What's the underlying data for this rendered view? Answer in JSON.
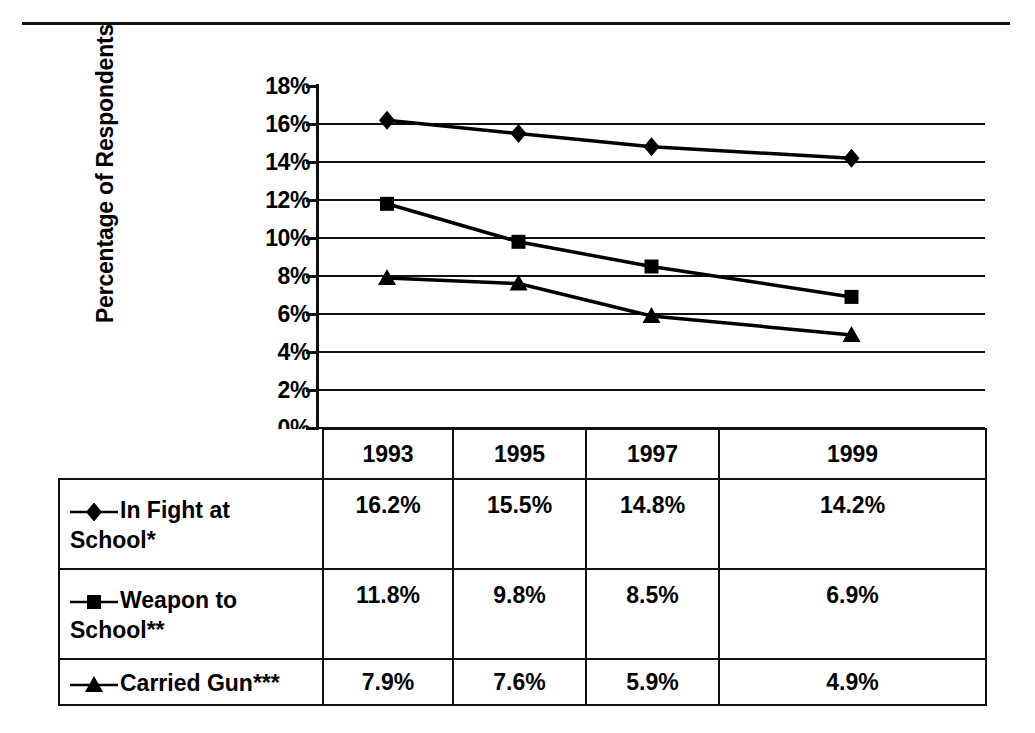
{
  "chart_data": {
    "type": "line",
    "title": "",
    "subtitle": "",
    "xlabel": "",
    "ylabel": "Percentage of Respondents",
    "categories": [
      "1993",
      "1995",
      "1997",
      "1999"
    ],
    "x": [
      1993,
      1995,
      1997,
      1999
    ],
    "ylim": [
      0,
      18
    ],
    "ytick_step": 2,
    "ytick_labels": [
      "18%",
      "16%",
      "14%",
      "12%",
      "10%",
      "8%",
      "6%",
      "4%",
      "2%",
      "0%"
    ],
    "ytick_values": [
      18,
      16,
      14,
      12,
      10,
      8,
      6,
      4,
      2,
      0
    ],
    "grid": true,
    "legend_position": "table-below",
    "series": [
      {
        "name": "In Fight at School*",
        "marker": "diamond",
        "color": "#000000",
        "values": [
          16.2,
          15.5,
          14.8,
          14.2
        ],
        "labels": [
          "16.2%",
          "15.5%",
          "14.8%",
          "14.2%"
        ]
      },
      {
        "name": "Weapon to School**",
        "marker": "square",
        "color": "#000000",
        "values": [
          11.8,
          9.8,
          8.5,
          6.9
        ],
        "labels": [
          "11.8%",
          "9.8%",
          "8.5%",
          "6.9%"
        ]
      },
      {
        "name": "Carried Gun***",
        "marker": "triangle",
        "color": "#000000",
        "values": [
          7.9,
          7.6,
          5.9,
          4.9
        ],
        "labels": [
          "7.9%",
          "7.6%",
          "5.9%",
          "4.9%"
        ]
      }
    ]
  },
  "table": {
    "corner_label": "",
    "column_headers": [
      "1993",
      "1995",
      "1997",
      "1999"
    ],
    "rows": [
      {
        "legend_label": "In Fight at School*",
        "marker": "diamond",
        "cells": [
          "16.2%",
          "15.5%",
          "14.8%",
          "14.2%"
        ]
      },
      {
        "legend_label": "Weapon to School**",
        "marker": "square",
        "cells": [
          "11.8%",
          "9.8%",
          "8.5%",
          "6.9%"
        ]
      },
      {
        "legend_label": "Carried Gun***",
        "marker": "triangle",
        "cells": [
          "7.9%",
          "7.6%",
          "5.9%",
          "4.9%"
        ]
      }
    ]
  },
  "colors": {
    "ink": "#000000",
    "rule": "#111111",
    "background": "#ffffff"
  }
}
